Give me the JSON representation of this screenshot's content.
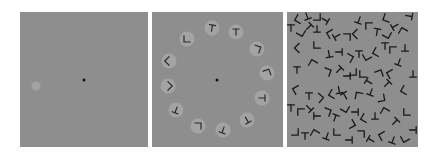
{
  "figure": {
    "panels": [
      {
        "id": "panel-1",
        "description": "single grey disc with fixation point",
        "background": "#8e8e8e",
        "fixation": {
          "x": 64,
          "y": 68,
          "r": 1.5,
          "color": "#111111"
        },
        "discs": [
          {
            "x": 16,
            "y": 74,
            "r": 4.5,
            "color": "#a2a2a2"
          }
        ]
      },
      {
        "id": "panel-2",
        "description": "ring of 12 grey discs each containing a letter-like glyph, fixation point at center",
        "background": "#8e8e8e",
        "fixation": {
          "x": 65,
          "y": 68,
          "r": 1.5,
          "color": "#111111"
        },
        "disc_color": "#a3a3a3",
        "glyph_color": "#2a2a2a",
        "items": [
          {
            "x": 60,
            "y": 16,
            "glyph": "T",
            "rot": 10
          },
          {
            "x": 84,
            "y": 20,
            "glyph": "T",
            "rot": 0
          },
          {
            "x": 35,
            "y": 27,
            "glyph": "L",
            "rot": 0
          },
          {
            "x": 105,
            "y": 37,
            "glyph": "L",
            "rot": 200
          },
          {
            "x": 17,
            "y": 49,
            "glyph": "L",
            "rot": 45
          },
          {
            "x": 115,
            "y": 61,
            "glyph": "L",
            "rot": 160
          },
          {
            "x": 16,
            "y": 74,
            "glyph": "L",
            "rot": 225
          },
          {
            "x": 110,
            "y": 86,
            "glyph": "T",
            "rot": 90
          },
          {
            "x": 24,
            "y": 98,
            "glyph": "T",
            "rot": 200
          },
          {
            "x": 95,
            "y": 108,
            "glyph": "T",
            "rot": 150
          },
          {
            "x": 46,
            "y": 114,
            "glyph": "L",
            "rot": 180
          },
          {
            "x": 71,
            "y": 118,
            "glyph": "T",
            "rot": 200
          }
        ]
      },
      {
        "id": "panel-3",
        "description": "dense clutter of overlapping black T and L glyphs",
        "background": "#8e8e8e",
        "glyph_color": "#1a1a1a",
        "items": [
          {
            "x": 12,
            "y": 7,
            "glyph": "L",
            "rot": 30
          },
          {
            "x": 20,
            "y": 4,
            "glyph": "T",
            "rot": 160
          },
          {
            "x": 30,
            "y": 5,
            "glyph": "L",
            "rot": 270
          },
          {
            "x": 38,
            "y": 8,
            "glyph": "T",
            "rot": 120
          },
          {
            "x": 4,
            "y": 16,
            "glyph": "T",
            "rot": 0
          },
          {
            "x": 14,
            "y": 20,
            "glyph": "L",
            "rot": 300
          },
          {
            "x": 22,
            "y": 15,
            "glyph": "T",
            "rot": 45
          },
          {
            "x": 30,
            "y": 17,
            "glyph": "T",
            "rot": 180
          },
          {
            "x": 44,
            "y": 22,
            "glyph": "L",
            "rot": 60
          },
          {
            "x": 50,
            "y": 24,
            "glyph": "T",
            "rot": 240
          },
          {
            "x": 60,
            "y": 25,
            "glyph": "L",
            "rot": 180
          },
          {
            "x": 70,
            "y": 22,
            "glyph": "L",
            "rot": 45
          },
          {
            "x": 72,
            "y": 8,
            "glyph": "T",
            "rot": 200
          },
          {
            "x": 82,
            "y": 14,
            "glyph": "L",
            "rot": 90
          },
          {
            "x": 90,
            "y": 20,
            "glyph": "T",
            "rot": 10
          },
          {
            "x": 100,
            "y": 22,
            "glyph": "L",
            "rot": 300
          },
          {
            "x": 108,
            "y": 14,
            "glyph": "T",
            "rot": 240
          },
          {
            "x": 116,
            "y": 20,
            "glyph": "L",
            "rot": 120
          },
          {
            "x": 122,
            "y": 4,
            "glyph": "T",
            "rot": 100
          },
          {
            "x": 100,
            "y": 6,
            "glyph": "L",
            "rot": 20
          },
          {
            "x": 12,
            "y": 36,
            "glyph": "L",
            "rot": 45
          },
          {
            "x": 30,
            "y": 33,
            "glyph": "L",
            "rot": 0
          },
          {
            "x": 42,
            "y": 42,
            "glyph": "T",
            "rot": 170
          },
          {
            "x": 52,
            "y": 40,
            "glyph": "T",
            "rot": 90
          },
          {
            "x": 62,
            "y": 46,
            "glyph": "L",
            "rot": 210
          },
          {
            "x": 72,
            "y": 42,
            "glyph": "T",
            "rot": 0
          },
          {
            "x": 80,
            "y": 44,
            "glyph": "L",
            "rot": 330
          },
          {
            "x": 90,
            "y": 40,
            "glyph": "L",
            "rot": 30
          },
          {
            "x": 98,
            "y": 34,
            "glyph": "T",
            "rot": 0
          },
          {
            "x": 106,
            "y": 38,
            "glyph": "L",
            "rot": 90
          },
          {
            "x": 118,
            "y": 36,
            "glyph": "T",
            "rot": 180
          },
          {
            "x": 112,
            "y": 50,
            "glyph": "T",
            "rot": 200
          },
          {
            "x": 10,
            "y": 58,
            "glyph": "T",
            "rot": 0
          },
          {
            "x": 26,
            "y": 52,
            "glyph": "L",
            "rot": 120
          },
          {
            "x": 40,
            "y": 60,
            "glyph": "L",
            "rot": 200
          },
          {
            "x": 52,
            "y": 58,
            "glyph": "T",
            "rot": 45
          },
          {
            "x": 60,
            "y": 64,
            "glyph": "T",
            "rot": 90
          },
          {
            "x": 66,
            "y": 60,
            "glyph": "L",
            "rot": 270
          },
          {
            "x": 76,
            "y": 62,
            "glyph": "L",
            "rot": 0
          },
          {
            "x": 82,
            "y": 70,
            "glyph": "T",
            "rot": 300
          },
          {
            "x": 92,
            "y": 62,
            "glyph": "L",
            "rot": 160
          },
          {
            "x": 100,
            "y": 72,
            "glyph": "T",
            "rot": 45
          },
          {
            "x": 104,
            "y": 62,
            "glyph": "L",
            "rot": 60
          },
          {
            "x": 126,
            "y": 62,
            "glyph": "T",
            "rot": 180
          },
          {
            "x": 10,
            "y": 78,
            "glyph": "L",
            "rot": 60
          },
          {
            "x": 22,
            "y": 84,
            "glyph": "T",
            "rot": 0
          },
          {
            "x": 32,
            "y": 86,
            "glyph": "L",
            "rot": 220
          },
          {
            "x": 46,
            "y": 82,
            "glyph": "L",
            "rot": 30
          },
          {
            "x": 52,
            "y": 78,
            "glyph": "T",
            "rot": 170
          },
          {
            "x": 58,
            "y": 84,
            "glyph": "T",
            "rot": 330
          },
          {
            "x": 72,
            "y": 84,
            "glyph": "L",
            "rot": 100
          },
          {
            "x": 84,
            "y": 80,
            "glyph": "T",
            "rot": 200
          },
          {
            "x": 94,
            "y": 86,
            "glyph": "L",
            "rot": 260
          },
          {
            "x": 118,
            "y": 78,
            "glyph": "L",
            "rot": 30
          },
          {
            "x": 4,
            "y": 96,
            "glyph": "T",
            "rot": 0
          },
          {
            "x": 14,
            "y": 100,
            "glyph": "L",
            "rot": 90
          },
          {
            "x": 22,
            "y": 96,
            "glyph": "T",
            "rot": 135
          },
          {
            "x": 30,
            "y": 104,
            "glyph": "T",
            "rot": 270
          },
          {
            "x": 40,
            "y": 100,
            "glyph": "L",
            "rot": 200
          },
          {
            "x": 48,
            "y": 106,
            "glyph": "T",
            "rot": 20
          },
          {
            "x": 58,
            "y": 96,
            "glyph": "L",
            "rot": 300
          },
          {
            "x": 68,
            "y": 100,
            "glyph": "T",
            "rot": 90
          },
          {
            "x": 78,
            "y": 106,
            "glyph": "L",
            "rot": 30
          },
          {
            "x": 88,
            "y": 104,
            "glyph": "T",
            "rot": 180
          },
          {
            "x": 98,
            "y": 100,
            "glyph": "L",
            "rot": 120
          },
          {
            "x": 108,
            "y": 110,
            "glyph": "T",
            "rot": 45
          },
          {
            "x": 120,
            "y": 100,
            "glyph": "L",
            "rot": 0
          },
          {
            "x": 8,
            "y": 120,
            "glyph": "L",
            "rot": 270
          },
          {
            "x": 18,
            "y": 124,
            "glyph": "T",
            "rot": 0
          },
          {
            "x": 28,
            "y": 122,
            "glyph": "L",
            "rot": 120
          },
          {
            "x": 40,
            "y": 124,
            "glyph": "T",
            "rot": 200
          },
          {
            "x": 50,
            "y": 120,
            "glyph": "L",
            "rot": 0
          },
          {
            "x": 62,
            "y": 128,
            "glyph": "T",
            "rot": 90
          },
          {
            "x": 74,
            "y": 122,
            "glyph": "L",
            "rot": 180
          },
          {
            "x": 84,
            "y": 128,
            "glyph": "T",
            "rot": 300
          },
          {
            "x": 96,
            "y": 124,
            "glyph": "L",
            "rot": 60
          },
          {
            "x": 106,
            "y": 128,
            "glyph": "T",
            "rot": 200
          },
          {
            "x": 118,
            "y": 126,
            "glyph": "L",
            "rot": 330
          },
          {
            "x": 126,
            "y": 118,
            "glyph": "T",
            "rot": 90
          },
          {
            "x": 64,
            "y": 112,
            "glyph": "L",
            "rot": 240
          }
        ]
      }
    ]
  }
}
